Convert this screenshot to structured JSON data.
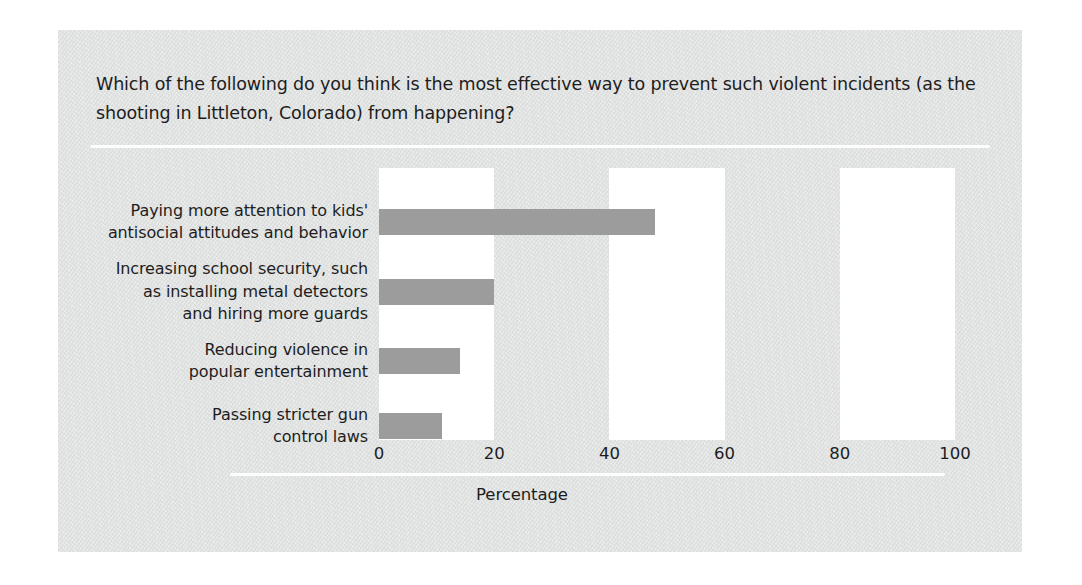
{
  "question": "Which of the following do you think is the most effective way to prevent such violent incidents (as the shooting in Littleton, Colorado) from happening?",
  "axis_title": "Percentage",
  "colors": {
    "page_background": "#ffffff",
    "panel_background": "#e2e3e3",
    "plot_band": "#ffffff",
    "bar": "#9c9c9c",
    "text": "#1d1d1d",
    "rule": "#fdfdfd"
  },
  "chart_data": {
    "type": "bar",
    "orientation": "horizontal",
    "title": "Which of the following do you think is the most effective way to prevent such violent incidents (as the shooting in Littleton, Colorado) from happening?",
    "xlabel": "Percentage",
    "ylabel": "",
    "categories": [
      "Paying more attention to kids'\nantisocial attitudes and behavior",
      "Increasing school security, such\nas installing metal detectors\nand hiring more guards",
      "Reducing violence in\npopular entertainment",
      "Passing stricter gun\ncontrol laws"
    ],
    "values": [
      48,
      20,
      14,
      11
    ],
    "xlim": [
      0,
      100
    ],
    "xticks": [
      "0",
      "20",
      "40",
      "60",
      "80",
      "100"
    ],
    "xtick_values": [
      0,
      20,
      40,
      60,
      80,
      100
    ],
    "grid": false,
    "legend": false,
    "bands": [
      {
        "from": 0,
        "to": 20
      },
      {
        "from": 40,
        "to": 60
      },
      {
        "from": 80,
        "to": 100
      }
    ]
  }
}
